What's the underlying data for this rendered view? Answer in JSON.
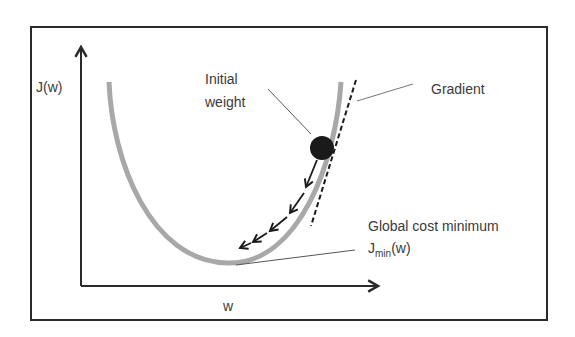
{
  "diagram": {
    "axes": {
      "y_label": "J(w)",
      "x_label": "w"
    },
    "annotations": {
      "initial_weight_line1": "Initial",
      "initial_weight_line2": "weight",
      "gradient": "Gradient",
      "global_min_line1": "Global cost minimum",
      "global_min_J": "J",
      "global_min_sub": "min",
      "global_min_arg": "(w)"
    },
    "colors": {
      "frame": "#2a2a2a",
      "curve": "#a8a8a8",
      "ball": "#1a1a1a",
      "text": "#3a3a3a",
      "leader": "#555555"
    },
    "step_arrows": 5
  }
}
